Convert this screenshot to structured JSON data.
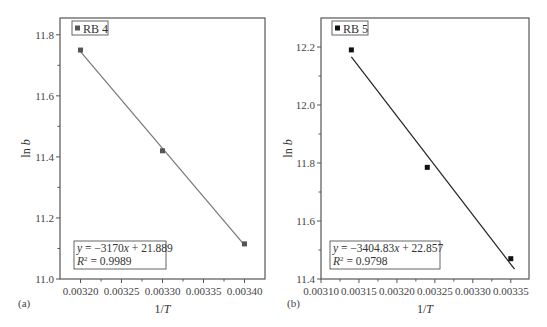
{
  "chart_data": [
    {
      "type": "scatter",
      "panel_label": "(a)",
      "title": "",
      "legend": [
        "RB 4"
      ],
      "xlabel": "1/T",
      "ylabel": "ln b",
      "xlim": [
        0.003175,
        0.003425
      ],
      "ylim": [
        11.0,
        11.855
      ],
      "xticks": [
        0.0032,
        0.00325,
        0.0033,
        0.00335,
        0.0034
      ],
      "xtick_labels": [
        "0.00320",
        "0.00325",
        "0.00330",
        "0.00335",
        "0.00340"
      ],
      "yticks": [
        11.0,
        11.2,
        11.4,
        11.6,
        11.8
      ],
      "ytick_labels": [
        "11.0",
        "11.2",
        "11.4",
        "11.6",
        "11.8"
      ],
      "series": [
        {
          "name": "RB 4",
          "x": [
            0.0032,
            0.0033,
            0.0034
          ],
          "y": [
            11.75,
            11.42,
            11.115
          ],
          "color": "#555555"
        }
      ],
      "fit": {
        "slope": -3170,
        "intercept": 21.889,
        "x_range": [
          0.0032,
          0.0034
        ],
        "color": "#777777"
      },
      "equation": "y = −3170x + 21.889",
      "r2": "R² = 0.9989",
      "grid": false,
      "legend_position": "top-left"
    },
    {
      "type": "scatter",
      "panel_label": "(b)",
      "title": "",
      "legend": [
        "RB 5"
      ],
      "xlabel": "1/T",
      "ylabel": "ln b",
      "xlim": [
        0.0031,
        0.003374
      ],
      "ylim": [
        11.4,
        12.3
      ],
      "xticks": [
        0.0031,
        0.00315,
        0.0032,
        0.00325,
        0.0033,
        0.00335
      ],
      "xtick_labels": [
        "0.00310",
        "0.00315",
        "0.00320",
        "0.00325",
        "0.00330",
        "0.00335"
      ],
      "yticks": [
        11.4,
        11.6,
        11.8,
        12.0,
        12.2
      ],
      "ytick_labels": [
        "11.4",
        "11.6",
        "11.8",
        "12.0",
        "12.2"
      ],
      "series": [
        {
          "name": "RB 5",
          "x": [
            0.00314,
            0.00324,
            0.00335
          ],
          "y": [
            12.19,
            11.785,
            11.47
          ],
          "color": "#111111"
        }
      ],
      "fit": {
        "slope": -3404.83,
        "intercept": 22.857,
        "x_range": [
          0.00314,
          0.003355
        ],
        "color": "#222222"
      },
      "equation": "y = −3404.83x + 22.857",
      "r2": "R² = 0.9798",
      "grid": false,
      "legend_position": "top-left"
    }
  ],
  "panels": [
    {
      "label": "(a)",
      "legend": "RB 4",
      "xlabel": "1/T",
      "ylabel": "ln b",
      "eq_prefix": "y",
      "eq_body": " = −3170",
      "eq_x": "x",
      "eq_tail": " + 21.889",
      "r2_prefix": "R",
      "r2_sup": "2",
      "r2_value": " = 0.9989"
    },
    {
      "label": "(b)",
      "legend": "RB 5",
      "xlabel": "1/T",
      "ylabel": "ln b",
      "eq_prefix": "y",
      "eq_body": " = −3404.83",
      "eq_x": "x",
      "eq_tail": " + 22.857",
      "r2_prefix": "R",
      "r2_sup": "2",
      "r2_value": " = 0.9798"
    }
  ]
}
